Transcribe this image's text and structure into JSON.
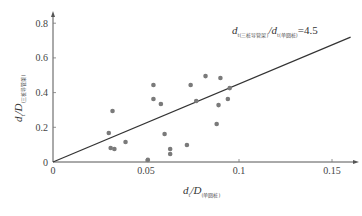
{
  "chart_data": {
    "type": "scatter",
    "title": "",
    "xlabel": "d_t/D_(单圆桩)",
    "ylabel": "d_t/D_(三桩导管架)",
    "xlim": [
      0,
      0.16
    ],
    "ylim": [
      0,
      0.85
    ],
    "x_ticks": [
      0,
      0.05,
      0.1,
      0.15
    ],
    "x_tick_labels": [
      "0",
      "0.05",
      "0.1",
      "0.15"
    ],
    "y_ticks": [
      0,
      0.2,
      0.4,
      0.6,
      0.8
    ],
    "y_tick_labels": [
      "0",
      "0.2",
      "0.4",
      "0.6",
      "0.8"
    ],
    "grid": false,
    "legend": null,
    "series": [
      {
        "name": "observations",
        "type": "scatter",
        "x": [
          0.03,
          0.031,
          0.033,
          0.032,
          0.039,
          0.051,
          0.054,
          0.054,
          0.058,
          0.06,
          0.063,
          0.063,
          0.072,
          0.074,
          0.077,
          0.082,
          0.088,
          0.089,
          0.09,
          0.094,
          0.095
        ],
        "y": [
          0.167,
          0.081,
          0.075,
          0.294,
          0.115,
          0.012,
          0.444,
          0.363,
          0.334,
          0.161,
          0.075,
          0.046,
          0.098,
          0.444,
          0.352,
          0.495,
          0.219,
          0.328,
          0.484,
          0.363,
          0.426
        ]
      },
      {
        "name": "fit line",
        "type": "line",
        "slope": 4.5,
        "x": [
          0,
          0.16
        ],
        "y": [
          0,
          0.72
        ]
      }
    ],
    "annotations": [
      {
        "text": "d_t(三桩导管架)/d_t(单圆桩)=4.5",
        "x": 0.085,
        "y": 0.69
      }
    ]
  },
  "labels": {
    "annotation_main_1": "d",
    "annotation_sub_1": "t(三桩导管架)",
    "annotation_main_2": "/d",
    "annotation_sub_2": "t(单圆桩)",
    "annotation_tail": "=4.5",
    "xlabel_main": "d",
    "xlabel_sub1": "t",
    "xlabel_main2": "/D",
    "xlabel_sub2": "(单圆桩)",
    "ylabel_main": "d",
    "ylabel_sub1": "t",
    "ylabel_main2": "/D",
    "ylabel_sub2": "(三桩导管架)",
    "origin_x": "0",
    "origin_y": "0"
  },
  "colors": {
    "point": "#7a7a7a",
    "line": "#333333",
    "axis": "#555555"
  }
}
